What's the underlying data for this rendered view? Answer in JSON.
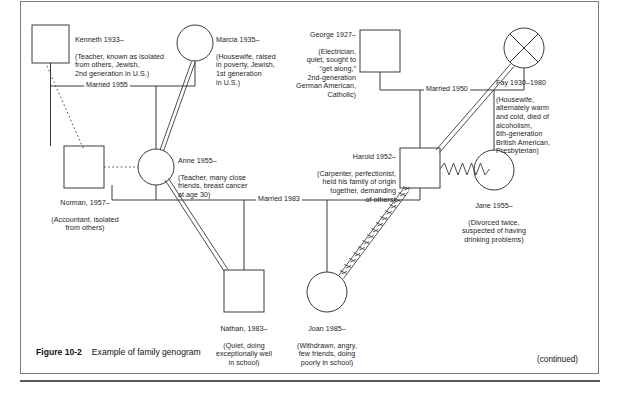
{
  "figure": {
    "number": "Figure 10-2",
    "caption": "Example of family genogram",
    "continued_note": "(continued)"
  },
  "genogram": {
    "people": [
      {
        "id": "kenneth",
        "shape": "square",
        "gender": "male",
        "name_line": "Kenneth 1933–",
        "detail": "(Teacher, known as isolated\nfrom others, Jewish,\n2nd generation in U.S.)"
      },
      {
        "id": "marcia",
        "shape": "circle",
        "gender": "female",
        "name_line": "Marcia 1935–",
        "detail": "(Housewife, raised\nin poverty, Jewish,\n1st generation\nin U.S.)"
      },
      {
        "id": "george",
        "shape": "square",
        "gender": "male",
        "name_line": "George 1927–",
        "detail": "(Electrician,\nquiet, sought to\n“get along,”\n2nd-generation\nGerman American,\nCatholic)"
      },
      {
        "id": "fay",
        "shape": "circle-crossed",
        "gender": "female",
        "deceased": true,
        "name_line": "Fay 1930–1980",
        "detail": "(Housewife,\nalternately warm\nand cold, died of\nalcoholism,\n6th-generation\nBritish American,\nPresbyterian)"
      },
      {
        "id": "norman",
        "shape": "square",
        "gender": "male",
        "name_line": "Norman, 1957–",
        "detail": "(Accountant, isolated\nfrom others)"
      },
      {
        "id": "anne",
        "shape": "circle",
        "gender": "female",
        "name_line": "Anne 1955–",
        "detail": "(Teacher, many close\nfriends, breast cancer\nat age 30)"
      },
      {
        "id": "harold",
        "shape": "square",
        "gender": "male",
        "name_line": "Harold 1952–",
        "detail": "(Carpenter, perfectionist,\nheld his family of origin\ntogether, demanding\nof others)"
      },
      {
        "id": "jane",
        "shape": "circle",
        "gender": "female",
        "name_line": "Jane 1955–",
        "detail": "(Divorced twice,\nsuspected of having\ndrinking problems)"
      },
      {
        "id": "nathan",
        "shape": "square",
        "gender": "male",
        "name_line": "Nathan, 1983–",
        "detail": "(Quiet, doing\nexceptionally well\nin school)"
      },
      {
        "id": "joan",
        "shape": "circle",
        "gender": "female",
        "name_line": "Joan 1985–",
        "detail": "(Withdrawn, angry,\nfew friends, doing\npoorly in school)"
      }
    ],
    "marriages": [
      {
        "id": "kenneth-marcia",
        "label": "Married 1955"
      },
      {
        "id": "george-fay",
        "label": "Married 1950"
      },
      {
        "id": "anne-harold",
        "label": "Married 1983"
      }
    ],
    "relationships": [
      {
        "id": "anne-marcia",
        "type": "close-double",
        "from": "anne",
        "to": "marcia"
      },
      {
        "id": "harold-fay",
        "type": "close-double",
        "from": "harold",
        "to": "fay"
      },
      {
        "id": "anne-nathan",
        "type": "close-double",
        "from": "anne",
        "to": "nathan"
      },
      {
        "id": "harold-jane",
        "type": "conflictual-zigzag",
        "from": "harold",
        "to": "jane"
      },
      {
        "id": "harold-joan",
        "type": "conflictual-zigzag",
        "from": "harold",
        "to": "joan"
      },
      {
        "id": "kenneth-norman",
        "type": "distant-dotted",
        "from": "kenneth",
        "to": "norman"
      },
      {
        "id": "norman-anne",
        "type": "distant-dotted",
        "from": "norman",
        "to": "anne"
      }
    ],
    "colors": {
      "line": "#3a3a3a",
      "text": "#1d1d1d",
      "frame": "#7c7c7c"
    }
  }
}
